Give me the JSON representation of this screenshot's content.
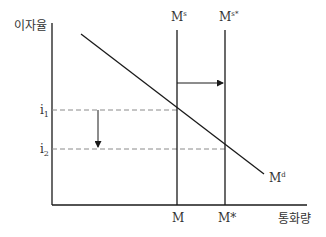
{
  "diagram": {
    "type": "money-market",
    "y_axis_label": "이자율",
    "x_axis_label": "통화량",
    "curves": {
      "supply_initial": {
        "label": "M",
        "sup": "s"
      },
      "supply_new": {
        "label": "M",
        "sup": "s*"
      },
      "demand": {
        "label": "M",
        "sup": "d"
      }
    },
    "y_ticks": [
      {
        "label": "i",
        "sub": "1"
      },
      {
        "label": "i",
        "sub": "2"
      }
    ],
    "x_ticks": [
      {
        "label": "M"
      },
      {
        "label": "M*"
      }
    ],
    "arrows": [
      {
        "name": "supply-shift-right",
        "from": "M",
        "to": "M*"
      },
      {
        "name": "interest-rate-fall",
        "from": "i1",
        "to": "i2"
      }
    ],
    "colors": {
      "line": "#1a1a1a",
      "dashed": "#8a8a8a",
      "text": "#333333"
    }
  }
}
